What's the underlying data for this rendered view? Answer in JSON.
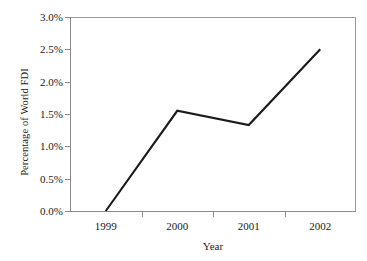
{
  "chart_data": {
    "type": "line",
    "title": "",
    "xlabel": "Year",
    "ylabel": "Percentage of World FDI",
    "categories": [
      "1999",
      "2000",
      "2001",
      "2002"
    ],
    "x": [
      1999,
      2000,
      2001,
      2002
    ],
    "values": [
      0.0,
      1.55,
      1.33,
      2.5
    ],
    "value_labels": [
      "0.0%",
      "1.55%",
      "1.33%",
      "2.50%"
    ],
    "series": [
      {
        "name": "Percentage of World FDI",
        "values": [
          0.0,
          1.55,
          1.33,
          2.5
        ]
      }
    ],
    "ylim": [
      0.0,
      3.0
    ],
    "ytick_values": [
      0.0,
      0.5,
      1.0,
      1.5,
      2.0,
      2.5,
      3.0
    ],
    "ytick_labels": [
      "0.0%",
      "0.5%",
      "1.0%",
      "1.5%",
      "2.0%",
      "2.5%",
      "3.0%"
    ],
    "xtick_labels": [
      "1999",
      "2000",
      "2001",
      "2002"
    ],
    "grid": false,
    "legend": false,
    "legend_position": "none",
    "line_color": "#1a1a1a",
    "axis_color": "#8a8a8a",
    "background_color": "#ffffff"
  },
  "axes": {
    "y_title": "Percentage of World FDI",
    "x_title": "Year"
  }
}
